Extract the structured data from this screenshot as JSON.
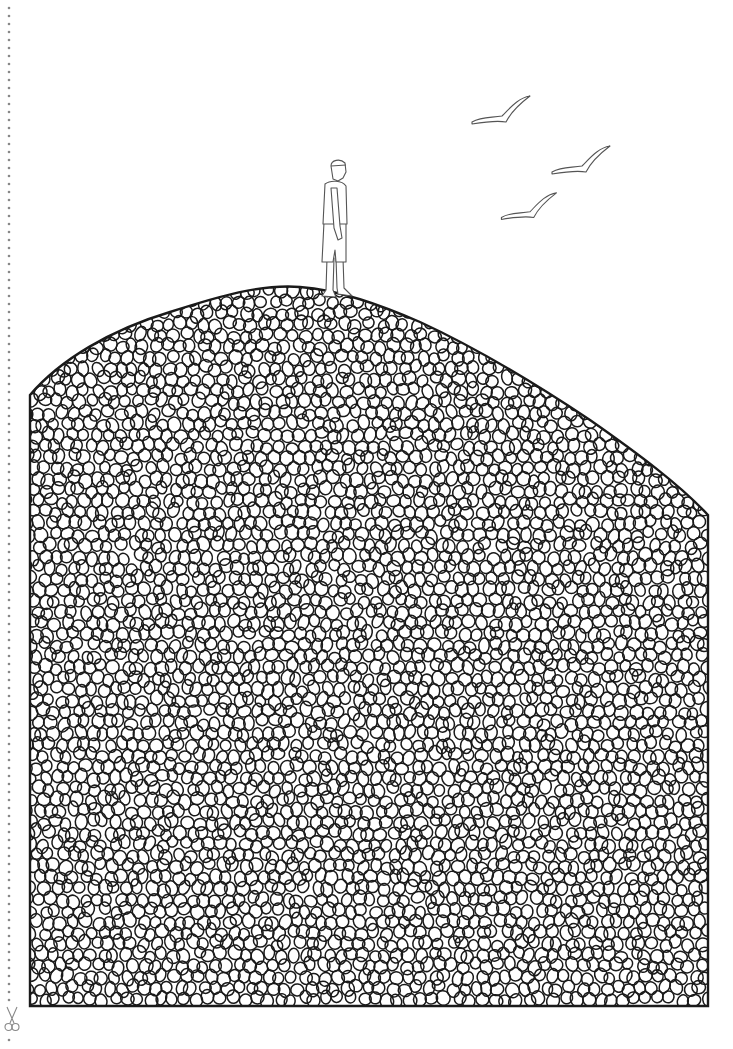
{
  "page": {
    "width": 733,
    "height": 1049,
    "background": "#ffffff",
    "line_color": "#1a1a1a",
    "light_line_color": "#555555",
    "cut_line_color": "#888888"
  },
  "cut_line": {
    "x": 9,
    "y_start": 8,
    "y_end": 1045,
    "dot_spacing": 8,
    "scissors_icon": {
      "name": "scissors-icon",
      "x": 12,
      "y": 1019
    }
  },
  "hill": {
    "outline": "M 30 1006 L 30 395 C 60 360, 110 330, 170 312 C 220 296, 260 284, 300 287 C 340 290, 380 305, 420 322 C 470 345, 530 380, 590 420 C 640 455, 680 485, 708 515 L 708 1006 Z",
    "pebble_seed": 7,
    "pebble_min_r": 6,
    "pebble_max_r": 11,
    "pebble_count": 2600
  },
  "figure": {
    "name": "standing-man",
    "x": 337,
    "y": 296
  },
  "birds": [
    {
      "name": "bird-1",
      "x": 500,
      "y": 112,
      "scale": 1.0
    },
    {
      "name": "bird-2",
      "x": 580,
      "y": 162,
      "scale": 1.0
    },
    {
      "name": "bird-3",
      "x": 528,
      "y": 208,
      "scale": 0.95
    }
  ]
}
